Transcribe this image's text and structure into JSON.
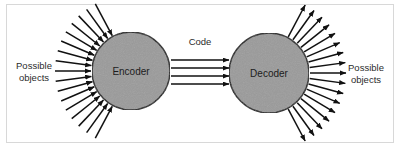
{
  "figure": {
    "width": 400,
    "height": 147,
    "background_color": "#ffffff",
    "border_color": "#d8d8d8"
  },
  "nodes": [
    {
      "id": "encoder",
      "label": "Encoder",
      "cx": 131,
      "cy": 71,
      "r": 39,
      "fill_color": "#9a9a9a",
      "stroke_color": "#1a1a1a"
    },
    {
      "id": "decoder",
      "label": "Decoder",
      "cx": 269,
      "cy": 73,
      "r": 40,
      "fill_color": "#9a9a9a",
      "stroke_color": "#1a1a1a"
    }
  ],
  "labels": {
    "left_side": {
      "line1": "Possible",
      "line2": "objects"
    },
    "right_side": {
      "line1": "Possible",
      "line2": "objects"
    },
    "code": "Code"
  },
  "code_channel": {
    "label": "Code",
    "arrow_count": 4,
    "direction": "encoder-to-decoder",
    "x_start": 171,
    "x_end": 229,
    "y_values": [
      60,
      68,
      76,
      84
    ]
  },
  "input_rays": {
    "description": "Arrows pointing inward toward the Encoder",
    "count": 17,
    "direction": "inward",
    "angle_start_deg": 118,
    "angle_end_deg": 242,
    "inner_radius": 40,
    "outer_radius": 76
  },
  "output_rays": {
    "description": "Arrows pointing outward from the Decoder",
    "count": 17,
    "direction": "outward",
    "angle_start_deg": -62,
    "angle_end_deg": 62,
    "inner_radius": 41,
    "outer_radius": 77
  },
  "colors": {
    "ink": "#111111",
    "node_fill": "#9a9a9a",
    "text": "#2b2b2b",
    "frame": "#d8d8d8"
  }
}
